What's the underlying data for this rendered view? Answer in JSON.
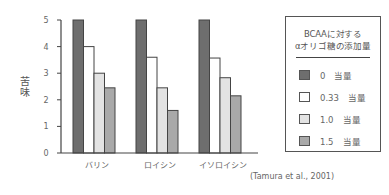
{
  "chart_data": {
    "type": "bar",
    "title": "",
    "xlabel": "",
    "ylabel": "苦味",
    "ylim": [
      0,
      5
    ],
    "yticks": [
      0,
      1,
      2,
      3,
      4,
      5
    ],
    "grid": false,
    "legend_position": "right",
    "categories": [
      "バリン",
      "ロイシン",
      "イソロイシン"
    ],
    "legend_title": [
      "BCAAに対する",
      "αオリゴ糖の添加量"
    ],
    "series": [
      {
        "name": "0 当量",
        "label": "0",
        "unit": "当量",
        "color": "#6e6e6e",
        "values": [
          5.0,
          5.0,
          5.0
        ]
      },
      {
        "name": "0.33 当量",
        "label": "0.33",
        "unit": "当量",
        "color": "#ffffff",
        "values": [
          4.0,
          3.6,
          3.57
        ]
      },
      {
        "name": "1.0 当量",
        "label": "1.0",
        "unit": "当量",
        "color": "#e3e3e3",
        "values": [
          3.0,
          2.45,
          2.83
        ]
      },
      {
        "name": "1.5 当量",
        "label": "1.5",
        "unit": "当量",
        "color": "#a9a9a9",
        "values": [
          2.45,
          1.6,
          2.15
        ]
      }
    ],
    "annotations": [
      "(Tamura et al., 2001)"
    ]
  },
  "legend": {
    "title_line1": "BCAAに対する",
    "title_line2": "αオリゴ糖の添加量",
    "items": [
      {
        "label": "0　当量"
      },
      {
        "label": "0.33　当量"
      },
      {
        "label": "1.0　当量"
      },
      {
        "label": "1.5　当量"
      }
    ]
  },
  "citation": "(Tamura et al., 2001)",
  "axis": {
    "ylabel": "苦味"
  }
}
